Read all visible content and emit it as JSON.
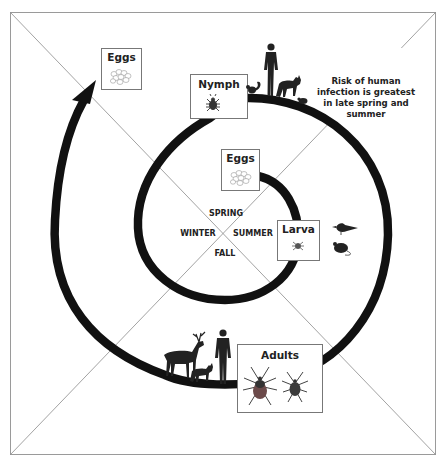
{
  "seasons": {
    "spring": "SPRING",
    "summer": "SUMMER",
    "fall": "FALL",
    "winter": "WINTER"
  },
  "stages": {
    "eggs_start": "Eggs",
    "larva": "Larva",
    "nymph": "Nymph",
    "adults": "Adults",
    "eggs_end": "Eggs"
  },
  "note": {
    "lines": [
      "Risk of human",
      "infection is greatest",
      "in late spring and",
      "summer"
    ]
  },
  "hosts": {
    "larva": [
      "bird",
      "mouse"
    ],
    "nymph": [
      "squirrel",
      "human",
      "fox",
      "mouse"
    ],
    "adults": [
      "deer",
      "fox",
      "human"
    ]
  },
  "colors": {
    "spiral": "#111111",
    "frame": "#8a8a8a",
    "box_border": "#777777",
    "tick_body": "#3a3a3a",
    "tick_abdomen": "#6b4a4a"
  }
}
